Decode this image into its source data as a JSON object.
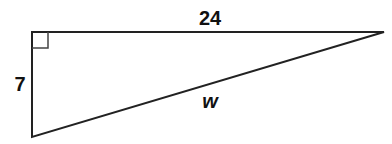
{
  "diagram": {
    "type": "right-triangle",
    "stroke_color": "#222222",
    "vertices": {
      "right_angle": [
        32,
        32
      ],
      "top_right": [
        384,
        32
      ],
      "bottom_left": [
        32,
        137
      ]
    },
    "labels": {
      "top_side": "24",
      "left_side": "7",
      "hypotenuse": "w"
    },
    "right_angle_marker": true
  }
}
